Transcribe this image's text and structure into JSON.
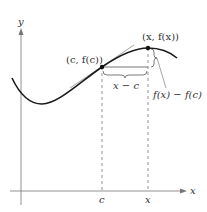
{
  "diagram": {
    "axes": {
      "x_label": "x",
      "y_label": "y"
    },
    "points": [
      {
        "id": "c_point",
        "label": "(c, f(c))",
        "px": [
          102,
          67
        ]
      },
      {
        "id": "x_point",
        "label": "(x, f(x))",
        "px": [
          148,
          48
        ]
      }
    ],
    "tick_labels": {
      "c": "c",
      "x": "x"
    },
    "annotations": {
      "horizontal_diff": "x − c",
      "vertical_diff": "f(x) − f(c)"
    },
    "colors": {
      "curve": "#1a1a1a",
      "axes": "#777777",
      "tangent": "#999999",
      "dashed": "#666666",
      "text": "#333333"
    }
  }
}
